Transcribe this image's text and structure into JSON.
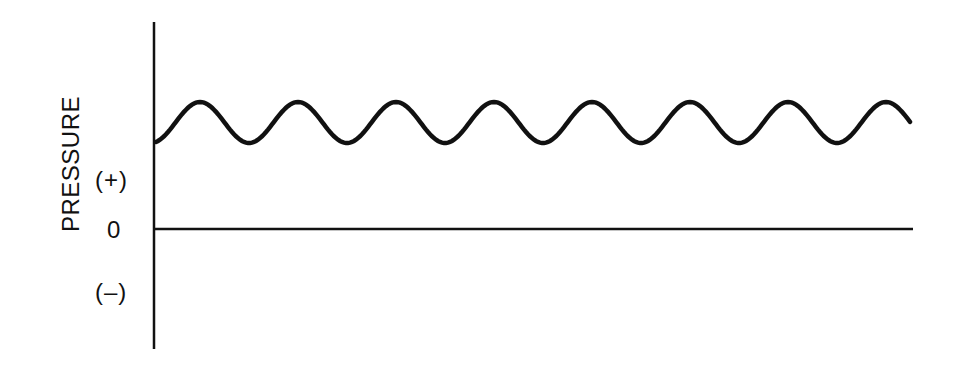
{
  "diagram": {
    "y_axis_title": "PRESSURE",
    "tick_labels": {
      "positive": "(+)",
      "zero": "0",
      "negative": "(–)"
    },
    "wave": {
      "description": "oscillating positive pressure above zero baseline",
      "cycles": 8,
      "color": "#111111"
    }
  },
  "chart_data": {
    "type": "line",
    "title": "",
    "ylabel": "PRESSURE",
    "xlabel": "",
    "y_ticks": [
      "(+)",
      "0",
      "(–)"
    ],
    "series": [
      {
        "name": "pressure",
        "shape": "sinusoid",
        "offset": "positive",
        "cycles": 7.6
      }
    ],
    "grid": false
  }
}
